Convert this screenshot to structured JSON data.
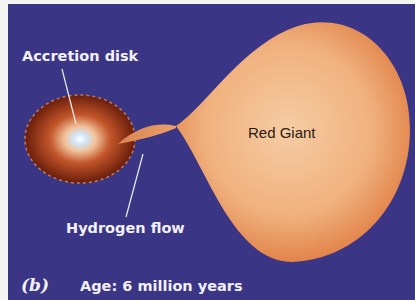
{
  "figure": {
    "panel_label": "(b)",
    "caption": "Age: 6 million years",
    "labels": {
      "accretion_disk": "Accretion disk",
      "hydrogen_flow": "Hydrogen flow",
      "red_giant": "Red Giant"
    },
    "colors": {
      "background": "#3b3585",
      "giant_center": "#f6c9a0",
      "giant_edge": "#e58a4e",
      "disk_outer": "#6e1f0c",
      "disk_inner": "#e48a52",
      "disk_core": "#dfeefa",
      "label_text": "#f2f0f8"
    }
  }
}
